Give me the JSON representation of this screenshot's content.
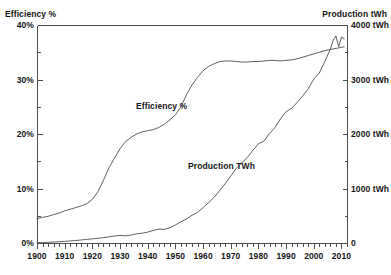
{
  "chart_data": {
    "type": "line",
    "title": "",
    "subtitle": "",
    "xlabel": "",
    "ylabel": "Efficiency %",
    "y2label": "Production tWh",
    "grid": false,
    "legend_position": "inline-annotation",
    "xlim": [
      1900,
      2012
    ],
    "ylim": [
      0,
      40
    ],
    "y2lim": [
      0,
      4000
    ],
    "x_ticks": [
      1900,
      1910,
      1920,
      1930,
      1940,
      1950,
      1960,
      1970,
      1980,
      1990,
      2000,
      2010
    ],
    "x_tick_labels": [
      "1900",
      "1910",
      "1920",
      "1930",
      "1940",
      "1950",
      "1960",
      "1970",
      "1980",
      "1990",
      "2000",
      "2010"
    ],
    "x_minor_tick_step": 2,
    "y_ticks": [
      0,
      10,
      20,
      30,
      40
    ],
    "y_tick_labels": [
      "0%",
      "10%",
      "20%",
      "30%",
      "40%"
    ],
    "y_minor_ticks": [
      5,
      15,
      25,
      35
    ],
    "y2_ticks": [
      0,
      1000,
      2000,
      3000,
      4000
    ],
    "y2_tick_labels": [
      "0",
      "1000 tWh",
      "2000 tWh",
      "3000 tWh",
      "4000 tWh"
    ],
    "y2_minor_ticks": [
      500,
      1500,
      2500,
      3500
    ],
    "annotations": [
      {
        "text": "Efficiency %",
        "x": 1948,
        "y": 24.5
      },
      {
        "text": "Production TWh",
        "x": 1972,
        "y": 15.5
      }
    ],
    "series": [
      {
        "name": "Efficiency %",
        "axis": "left",
        "unit": "%",
        "color": "#4d4d4d",
        "x": [
          1900,
          1902,
          1904,
          1906,
          1908,
          1910,
          1912,
          1914,
          1916,
          1918,
          1920,
          1922,
          1924,
          1926,
          1928,
          1930,
          1932,
          1934,
          1936,
          1938,
          1940,
          1942,
          1944,
          1946,
          1948,
          1950,
          1952,
          1954,
          1956,
          1958,
          1960,
          1962,
          1964,
          1966,
          1968,
          1970,
          1972,
          1974,
          1976,
          1978,
          1980,
          1982,
          1984,
          1986,
          1988,
          1990,
          1992,
          1994,
          1996,
          1998,
          2000,
          2002,
          2004,
          2006,
          2008,
          2010,
          2011
        ],
        "values": [
          4.5,
          4.7,
          4.9,
          5.2,
          5.5,
          5.9,
          6.2,
          6.5,
          6.8,
          7.2,
          8.0,
          9.4,
          11.5,
          13.8,
          15.6,
          17.3,
          18.6,
          19.4,
          20.0,
          20.4,
          20.6,
          20.8,
          21.2,
          21.8,
          22.6,
          23.5,
          25.0,
          27.2,
          29.0,
          30.4,
          31.6,
          32.4,
          32.9,
          33.3,
          33.4,
          33.4,
          33.3,
          33.2,
          33.2,
          33.3,
          33.3,
          33.4,
          33.5,
          33.5,
          33.4,
          33.5,
          33.6,
          33.8,
          34.1,
          34.4,
          34.7,
          35.0,
          35.3,
          35.5,
          35.7,
          35.9,
          36.0
        ]
      },
      {
        "name": "Production TWh",
        "axis": "right",
        "unit": "tWh",
        "color": "#4d4d4d",
        "x": [
          1900,
          1902,
          1904,
          1906,
          1908,
          1910,
          1912,
          1914,
          1916,
          1918,
          1920,
          1922,
          1924,
          1926,
          1928,
          1930,
          1932,
          1934,
          1936,
          1938,
          1940,
          1942,
          1944,
          1946,
          1948,
          1950,
          1952,
          1954,
          1956,
          1958,
          1960,
          1962,
          1964,
          1966,
          1968,
          1970,
          1972,
          1974,
          1976,
          1978,
          1980,
          1982,
          1984,
          1986,
          1988,
          1990,
          1992,
          1994,
          1996,
          1998,
          2000,
          2002,
          2004,
          2006,
          2007,
          2008,
          2009,
          2010,
          2011
        ],
        "values": [
          6,
          9,
          13,
          18,
          24,
          30,
          38,
          46,
          56,
          66,
          76,
          86,
          98,
          112,
          128,
          140,
          132,
          146,
          168,
          180,
          200,
          230,
          255,
          250,
          280,
          330,
          390,
          440,
          510,
          560,
          650,
          740,
          840,
          960,
          1090,
          1230,
          1370,
          1470,
          1570,
          1700,
          1820,
          1870,
          2010,
          2120,
          2280,
          2410,
          2470,
          2580,
          2700,
          2830,
          3010,
          3120,
          3330,
          3560,
          3720,
          3800,
          3600,
          3780,
          3750
        ]
      }
    ]
  },
  "axes": {
    "left_title": "Efficiency %",
    "right_title": "Production tWh"
  }
}
